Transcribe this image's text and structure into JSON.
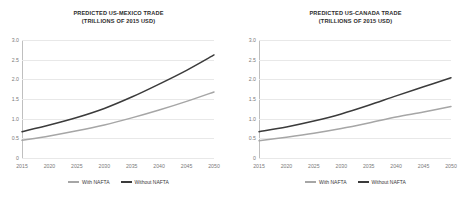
{
  "charts": [
    {
      "title_line1": "PREDICTED US-MEXICO TRADE",
      "title_line2": "(TRILLIONS OF 2015 USD)",
      "legend": [
        {
          "label": "With NAFTA",
          "color": "#a6a6a6"
        },
        {
          "label": "Without NAFTA",
          "color": "#3b3b3b"
        }
      ]
    },
    {
      "title_line1": "PREDICTED US-CANADA TRADE",
      "title_line2": "(TRILLIONS OF 2015 USD)",
      "legend": [
        {
          "label": "With NAFTA",
          "color": "#a6a6a6"
        },
        {
          "label": "Without NAFTA",
          "color": "#3b3b3b"
        }
      ]
    }
  ],
  "chart_data": [
    {
      "type": "line",
      "title": "PREDICTED US-MEXICO TRADE (TRILLIONS OF 2015 USD)",
      "xlabel": "",
      "ylabel": "",
      "x": [
        2015,
        2020,
        2025,
        2030,
        2035,
        2040,
        2045,
        2050
      ],
      "xlim": [
        2015,
        2050
      ],
      "ylim": [
        0,
        3.0
      ],
      "yticks": [
        0,
        0.5,
        1.0,
        1.5,
        2.0,
        2.5,
        3.0
      ],
      "ytick_labels": [
        "0",
        "0.5",
        "1.0",
        "1.5",
        "2.0",
        "2.5",
        "3.0"
      ],
      "xtick_labels": [
        "2015",
        "2020",
        "2025",
        "2030",
        "2035",
        "2040",
        "2045",
        "2050"
      ],
      "grid": true,
      "legend_position": "bottom",
      "series": [
        {
          "name": "With NAFTA",
          "color": "#a6a6a6",
          "values": [
            0.45,
            0.56,
            0.69,
            0.84,
            1.02,
            1.22,
            1.44,
            1.68
          ]
        },
        {
          "name": "Without NAFTA",
          "color": "#3b3b3b",
          "values": [
            0.67,
            0.84,
            1.03,
            1.26,
            1.55,
            1.88,
            2.23,
            2.62
          ]
        }
      ]
    },
    {
      "type": "line",
      "title": "PREDICTED US-CANADA TRADE (TRILLIONS OF 2015 USD)",
      "xlabel": "",
      "ylabel": "",
      "x": [
        2015,
        2020,
        2025,
        2030,
        2035,
        2040,
        2045,
        2050
      ],
      "xlim": [
        2015,
        2050
      ],
      "ylim": [
        0,
        3.0
      ],
      "yticks": [
        0,
        0.5,
        1.0,
        1.5,
        2.0,
        2.5,
        3.0
      ],
      "ytick_labels": [
        "0",
        "0.5",
        "1.0",
        "1.5",
        "2.0",
        "2.5",
        "3.0"
      ],
      "xtick_labels": [
        "2015",
        "2020",
        "2025",
        "2030",
        "2035",
        "2040",
        "2045",
        "2050"
      ],
      "grid": true,
      "legend_position": "bottom",
      "series": [
        {
          "name": "With NAFTA",
          "color": "#a6a6a6",
          "values": [
            0.44,
            0.53,
            0.63,
            0.75,
            0.89,
            1.04,
            1.17,
            1.31
          ]
        },
        {
          "name": "Without NAFTA",
          "color": "#3b3b3b",
          "values": [
            0.67,
            0.79,
            0.94,
            1.12,
            1.34,
            1.58,
            1.81,
            2.04
          ]
        }
      ]
    }
  ]
}
